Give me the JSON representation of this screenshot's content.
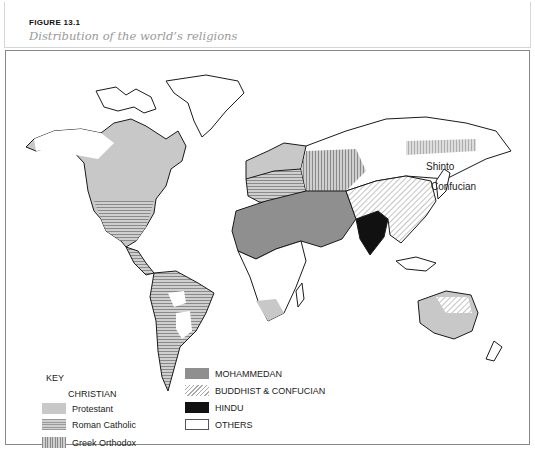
{
  "figure": {
    "label": "FIGURE 13.1",
    "title": "Distribution of the world’s religions"
  },
  "map": {
    "labels": {
      "shinto": "Shinto",
      "confucian": "Confucian"
    },
    "colors": {
      "protestant": "#c8c8c8",
      "roman_catholic_hatch": "#9a9a9a",
      "greek_orthodox_hatch": "#8a8a8a",
      "mohammedan": "#8f8f8f",
      "buddhist_confucian_hatch": "#aaaaaa",
      "hindu": "#111111",
      "others": "#ffffff",
      "coastline": "#1a1a1a"
    }
  },
  "key": {
    "title": "KEY",
    "christian": {
      "heading": "CHRISTIAN",
      "items": [
        {
          "label": "Protestant",
          "pattern": "light-grey-solid"
        },
        {
          "label": "Roman Catholic",
          "pattern": "horizontal-lines"
        },
        {
          "label": "Greek Orthodox",
          "pattern": "vertical-lines"
        }
      ]
    },
    "other_items": [
      {
        "label": "MOHAMMEDAN",
        "pattern": "dark-grey-solid"
      },
      {
        "label": "BUDDHIST & CONFUCIAN",
        "pattern": "diagonal-lines"
      },
      {
        "label": "HINDU",
        "pattern": "black-solid"
      },
      {
        "label": "OTHERS",
        "pattern": "white-outlined"
      }
    ]
  }
}
